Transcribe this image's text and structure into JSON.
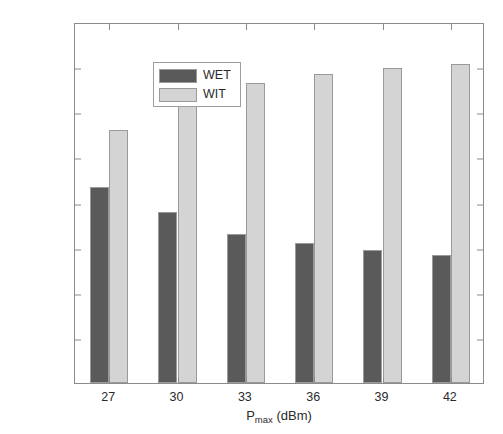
{
  "chart_data": {
    "type": "bar",
    "title": "",
    "xlabel": "P_max (dBm)",
    "xlabel_base": "P",
    "xlabel_sub": "max",
    "xlabel_unit": " (dBm)",
    "ylabel": "Time allocation ratio",
    "categories": [
      "27",
      "30",
      "33",
      "36",
      "39",
      "42"
    ],
    "series": [
      {
        "name": "WET",
        "color": "#5a5a5a",
        "values": [
          0.435,
          0.378,
          0.33,
          0.311,
          0.294,
          0.283
        ]
      },
      {
        "name": "WIT",
        "color": "#d4d4d4",
        "values": [
          0.561,
          0.619,
          0.665,
          0.685,
          0.699,
          0.708
        ]
      }
    ],
    "ylim": [
      0,
      0.8
    ],
    "ytick_values": [
      0,
      0.1,
      0.2,
      0.3,
      0.4,
      0.5,
      0.6,
      0.7,
      0.8
    ],
    "ytick_labels": [
      "0",
      "0.1",
      "0.2",
      "0.3",
      "0.4",
      "0.5",
      "0.6",
      "0.7",
      "0.8"
    ],
    "grid": false,
    "legend_position": "upper left",
    "bar_edge_color": "#9a9a9a",
    "axis_color": "#8c8c8c",
    "text_color": "#2b2b2b",
    "background": "#ffffff"
  }
}
